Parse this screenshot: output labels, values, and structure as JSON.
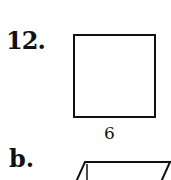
{
  "problem": {
    "number": "12.",
    "figure": {
      "shape": "square",
      "side_label": "6"
    }
  },
  "part_b": {
    "label": "b.",
    "figure": {
      "shape": "parallelogram"
    }
  }
}
